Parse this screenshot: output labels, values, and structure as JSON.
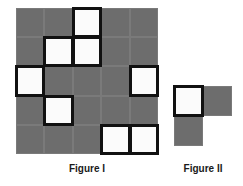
{
  "figure1": {
    "label": "Figure I",
    "rows": 5,
    "cols": 5,
    "origin": [
      16,
      8
    ],
    "cell_w": 28.4,
    "cell_h": 29.2,
    "white_cells": [
      [
        0,
        2
      ],
      [
        1,
        1
      ],
      [
        1,
        2
      ],
      [
        2,
        0
      ],
      [
        2,
        4
      ],
      [
        3,
        1
      ],
      [
        4,
        3
      ],
      [
        4,
        4
      ]
    ]
  },
  "figure2": {
    "label": "Figure II",
    "origin": [
      174,
      86
    ],
    "cell_w": 29,
    "cell_h": 30,
    "cells": [
      {
        "r": 0,
        "c": 0,
        "type": "light"
      },
      {
        "r": 0,
        "c": 1,
        "type": "dark"
      },
      {
        "r": 1,
        "c": 0,
        "type": "dark"
      }
    ]
  },
  "colors": {
    "dark": "#6d6d6d",
    "light": "#fbfbfb",
    "outline": "#111111"
  }
}
